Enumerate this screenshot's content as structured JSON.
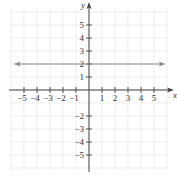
{
  "chart_data": {
    "type": "line",
    "title": "",
    "xlabel": "x",
    "ylabel": "y",
    "xlim": [
      -6,
      6
    ],
    "ylim": [
      -6,
      6
    ],
    "grid": true,
    "x_ticks": [
      -5,
      -4,
      -3,
      -2,
      -1,
      1,
      2,
      3,
      4,
      5
    ],
    "y_ticks": [
      -5,
      -4,
      -3,
      -2,
      1,
      2,
      3,
      4,
      5
    ],
    "x_tick_labels": [
      "−5",
      "−4",
      "−3",
      "−2",
      "−1",
      "1",
      "2",
      "3",
      "4",
      "5"
    ],
    "y_tick_labels": [
      "−5",
      "−4",
      "−3",
      "−2",
      "1",
      "2",
      "3",
      "4",
      "5"
    ],
    "series": [
      {
        "name": "y = 2",
        "equation": "y = 2",
        "x": [
          -5.8,
          5.9
        ],
        "y": [
          2,
          2
        ],
        "arrows": "both",
        "color": "#8a8a8a"
      }
    ]
  },
  "colors": {
    "axis": "#444444",
    "grid": "#e6e6e6",
    "line": "#8a8a8a"
  }
}
